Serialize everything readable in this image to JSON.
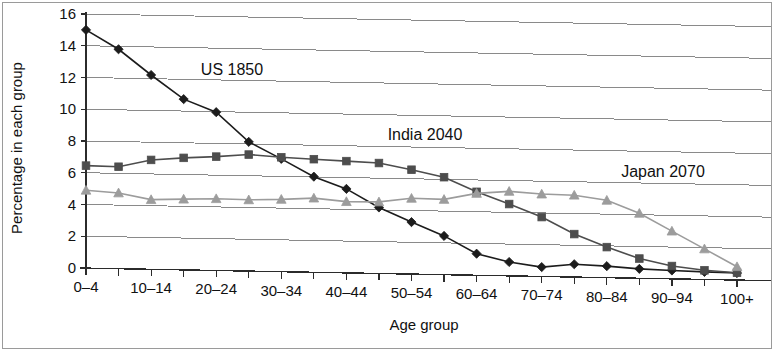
{
  "chart_data": {
    "type": "line",
    "title": "",
    "xlabel": "Age group",
    "ylabel": "Percentage in each group",
    "ylim": [
      0,
      16
    ],
    "ytick_step": 2,
    "ytick_labels": [
      "0",
      "2",
      "4",
      "6",
      "8",
      "10",
      "12",
      "14",
      "16"
    ],
    "grid": true,
    "legend_position": "inline-annotations",
    "categories": [
      "0–4",
      "5–9",
      "10–14",
      "15–19",
      "20–24",
      "25–29",
      "30–34",
      "35–39",
      "40–44",
      "45–49",
      "50–54",
      "55–59",
      "60–64",
      "65–69",
      "70–74",
      "75–79",
      "80–84",
      "85–89",
      "90–94",
      "95–99",
      "100+"
    ],
    "visible_tick_labels": [
      "0–4",
      "10–14",
      "20–24",
      "30–34",
      "40–44",
      "50–54",
      "60–64",
      "70–74",
      "80–84",
      "90–94",
      "100+"
    ],
    "series": [
      {
        "name": "US 1850",
        "color": "#1c1c1c",
        "marker": "diamond",
        "label_x_category": "15–19",
        "values": [
          15.0,
          13.8,
          12.2,
          10.7,
          9.9,
          8.05,
          7.0,
          5.9,
          5.15,
          4.0,
          3.1,
          2.25,
          1.15,
          0.65,
          0.35,
          0.55,
          0.45,
          0.3,
          0.22,
          0.15,
          0.1
        ]
      },
      {
        "name": "India 2040",
        "color": "#4d4d4d",
        "marker": "square",
        "label_x_category": "45–49",
        "values": [
          6.45,
          6.4,
          6.85,
          7.0,
          7.1,
          7.25,
          7.1,
          7.0,
          6.9,
          6.8,
          6.4,
          5.95,
          5.05,
          4.3,
          3.5,
          2.45,
          1.65,
          0.95,
          0.5,
          0.25,
          0.12
        ]
      },
      {
        "name": "Japan 2070",
        "color": "#9c9c9c",
        "marker": "triangle",
        "label_x_category": "75–79",
        "values": [
          4.9,
          4.75,
          4.35,
          4.4,
          4.45,
          4.4,
          4.45,
          4.55,
          4.35,
          4.35,
          4.6,
          4.55,
          4.95,
          5.1,
          4.95,
          4.9,
          4.6,
          3.8,
          2.7,
          1.6,
          0.5
        ]
      }
    ]
  }
}
